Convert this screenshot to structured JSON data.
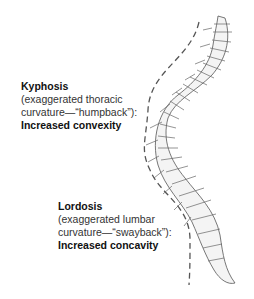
{
  "diagram": {
    "kyphosis": {
      "title": "Kyphosis",
      "desc_line1": "(exaggerated thoracic",
      "desc_line2": "curvature—“humpback”):",
      "result": "Increased convexity"
    },
    "lordosis": {
      "title": "Lordosis",
      "desc_line1": "(exaggerated lumbar",
      "desc_line2": "curvature—“swayback”):",
      "result": "Increased concavity"
    },
    "colors": {
      "outline": "#555555",
      "dashed_line": "#555555",
      "shading": "#e6e6e6"
    }
  }
}
